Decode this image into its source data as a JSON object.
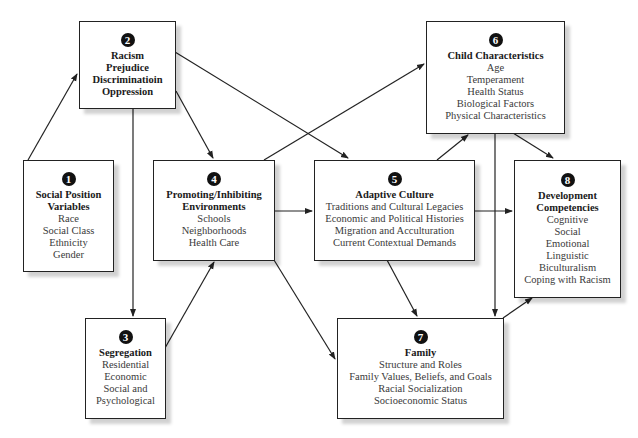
{
  "diagram": {
    "boxes": {
      "b1": {
        "number": "1",
        "title_lines": [
          "Social Position",
          "Variables"
        ],
        "items": [
          "Race",
          "Social Class",
          "Ethnicity",
          "Gender"
        ]
      },
      "b2": {
        "number": "2",
        "title_lines": [
          "Racism",
          "Prejudice",
          "Discriminatioin",
          "Oppression"
        ],
        "items": []
      },
      "b3": {
        "number": "3",
        "title_lines": [
          "Segregation"
        ],
        "items": [
          "Residential",
          "Economic",
          "Social and",
          "Psychological"
        ]
      },
      "b4": {
        "number": "4",
        "title_lines": [
          "Promoting/Inhibiting",
          "Environments"
        ],
        "items": [
          "Schools",
          "Neighborhoods",
          "Health Care"
        ]
      },
      "b5": {
        "number": "5",
        "title_lines": [
          "Adaptive Culture"
        ],
        "items": [
          "Traditions and Cultural Legacies",
          "Economic and Political Histories",
          "Migration and Acculturation",
          "Current Contextual Demands"
        ]
      },
      "b6": {
        "number": "6",
        "title_lines": [
          "Child Characteristics"
        ],
        "items": [
          "Age",
          "Temperament",
          "Health Status",
          "Biological Factors",
          "Physical Characteristics"
        ]
      },
      "b7": {
        "number": "7",
        "title_lines": [
          "Family"
        ],
        "items": [
          "Structure and Roles",
          "Family Values, Beliefs, and Goals",
          "Racial Socialization",
          "Socioeconomic Status"
        ]
      },
      "b8": {
        "number": "8",
        "title_lines": [
          "Development",
          "Competencies"
        ],
        "items": [
          "Cognitive",
          "Social",
          "Emotional",
          "Linguistic",
          "Biculturalism",
          "Coping with Racism"
        ]
      }
    },
    "edges": [
      {
        "from": "1",
        "to": "2"
      },
      {
        "from": "2",
        "to": "3"
      },
      {
        "from": "2",
        "to": "4"
      },
      {
        "from": "2",
        "to": "5"
      },
      {
        "from": "3",
        "to": "4"
      },
      {
        "from": "4",
        "to": "5"
      },
      {
        "from": "4",
        "to": "6"
      },
      {
        "from": "4",
        "to": "7"
      },
      {
        "from": "5",
        "to": "6"
      },
      {
        "from": "5",
        "to": "7"
      },
      {
        "from": "5",
        "to": "8"
      },
      {
        "from": "6",
        "to": "7"
      },
      {
        "from": "6",
        "to": "8"
      },
      {
        "from": "7",
        "to": "8"
      }
    ],
    "colors": {
      "line": "#222222",
      "number_badge": "#111111",
      "shadow": "#d0d0d0"
    }
  }
}
